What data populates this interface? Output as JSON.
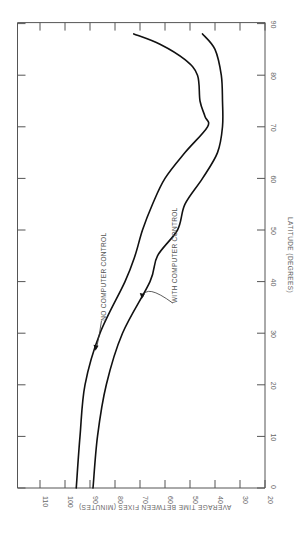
{
  "chart_data": {
    "type": "line",
    "orientation": "rotated-90-clockwise",
    "title": "",
    "xlabel": "LATITUDE (DEGREES)",
    "ylabel": "AVERAGE TIME BETWEEN FIXES (MINUTES)",
    "x_ticks": [
      0,
      10,
      20,
      30,
      40,
      50,
      60,
      70,
      80,
      90
    ],
    "y_ticks": [
      20,
      30,
      40,
      50,
      60,
      70,
      80,
      90,
      100,
      110
    ],
    "xlim": [
      0,
      90
    ],
    "ylim": [
      20,
      119
    ],
    "grid": false,
    "legend": "inline annotations",
    "series": [
      {
        "name": "NO COMPUTER CONTROL",
        "x": [
          0,
          10,
          20,
          30,
          40,
          45,
          50,
          55,
          60,
          65,
          70,
          72,
          75,
          80,
          83,
          86,
          88
        ],
        "values": [
          95.5,
          94,
          92,
          86,
          76,
          72,
          69,
          65,
          60,
          52,
          43,
          44,
          46,
          47,
          52,
          62,
          72.5
        ]
      },
      {
        "name": "WITH COMPUTER CONTROL",
        "x": [
          0,
          10,
          20,
          30,
          40,
          45,
          50,
          55,
          60,
          65,
          70,
          75,
          80,
          85,
          88
        ],
        "values": [
          88.8,
          87,
          83.5,
          77,
          66,
          63,
          55,
          52,
          45,
          39,
          37,
          37,
          37.5,
          40,
          45
        ]
      }
    ],
    "annotations": [
      {
        "text": "NO COMPUTER CONTROL",
        "series": 0,
        "at_latitude": 27
      },
      {
        "text": "WITH COMPUTER CONTROL",
        "series": 1,
        "at_latitude": 37
      }
    ]
  },
  "colors": {
    "curve": "#111111",
    "axis": "#555555",
    "text": "#666666"
  }
}
